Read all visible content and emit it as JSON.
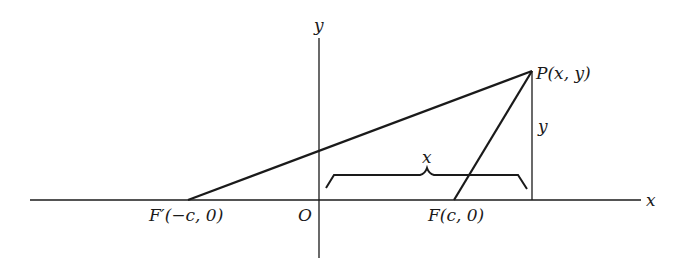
{
  "diagram": {
    "type": "ellipse-focal-geometry",
    "axes": {
      "x_label": "x",
      "y_label": "y",
      "origin_label": "O"
    },
    "points": {
      "P": {
        "label": "P(x, y)"
      },
      "F_prime": {
        "label": "F′(−c, 0)"
      },
      "F": {
        "label": "F(c, 0)"
      }
    },
    "measurements": {
      "horizontal_brace_label": "x",
      "vertical_segment_label": "y"
    },
    "colors": {
      "stroke": "#1a1a1a",
      "background": "#ffffff"
    }
  }
}
